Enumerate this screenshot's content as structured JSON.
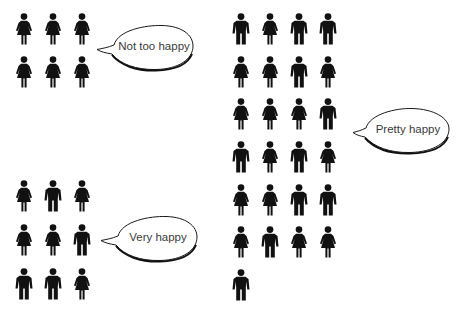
{
  "chart_data": {
    "type": "pictogram",
    "title": "",
    "unit": "1 figure = 1 person",
    "groups": [
      {
        "label": "Not too happy",
        "count": 6,
        "female": 6,
        "male": 0,
        "figures": [
          "F",
          "F",
          "F",
          "F",
          "F",
          "F"
        ]
      },
      {
        "label": "Pretty happy",
        "count": 25,
        "female": 13,
        "male": 12,
        "figures": [
          "M",
          "F",
          "M",
          "M",
          "F",
          "F",
          "M",
          "F",
          "F",
          "F",
          "F",
          "M",
          "M",
          "F",
          "M",
          "F",
          "F",
          "F",
          "M",
          "M",
          "F",
          "M",
          "F",
          "F",
          "M"
        ]
      },
      {
        "label": "Very happy",
        "count": 9,
        "female": 5,
        "male": 4,
        "figures": [
          "F",
          "M",
          "F",
          "F",
          "F",
          "M",
          "M",
          "M",
          "F"
        ]
      }
    ]
  },
  "bubbles": {
    "not_too_happy": "Not too happy",
    "pretty_happy": "Pretty happy",
    "very_happy": "Very happy"
  },
  "colors": {
    "figure": "#111111",
    "bubble_stroke": "#1a1a1a",
    "text": "#3a3a3a",
    "background": "#ffffff"
  }
}
